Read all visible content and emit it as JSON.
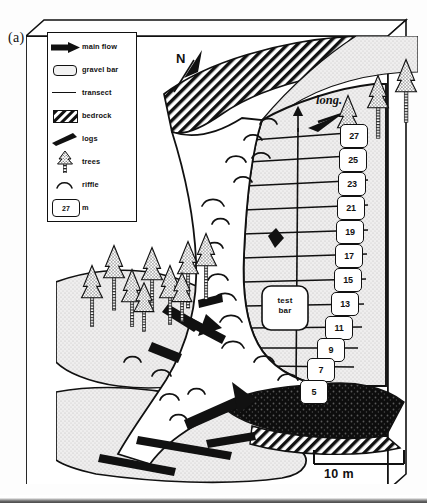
{
  "figure": {
    "panel_label": "(a)",
    "type": "geomorphic-map"
  },
  "legend": {
    "items": [
      {
        "symbol": "main-flow-arrow-icon",
        "label": "main flow"
      },
      {
        "symbol": "gravel-bar-swatch-icon",
        "label": "gravel bar"
      },
      {
        "symbol": "transect-line-icon",
        "label": "transect"
      },
      {
        "symbol": "bedrock-hatch-icon",
        "label": "bedrock"
      },
      {
        "symbol": "log-icon",
        "label": "logs"
      },
      {
        "symbol": "tree-icon",
        "label": "trees"
      },
      {
        "symbol": "riffle-arc-icon",
        "label": "riffle"
      },
      {
        "symbol": "transect-marker-icon",
        "label": "m",
        "box_value": "27"
      }
    ]
  },
  "annotations": {
    "north": "N",
    "longitudinal": "long.",
    "test_bar_line1": "test",
    "test_bar_line2": "bar"
  },
  "scalebar": {
    "label": "10 m",
    "length_m": 10
  },
  "transects": {
    "unit": "m",
    "labels": [
      "27",
      "25",
      "23",
      "21",
      "19",
      "17",
      "15",
      "13",
      "11",
      "9",
      "7",
      "5"
    ]
  },
  "colors": {
    "ink": "#111111",
    "paper": "#ffffff",
    "gravel_fill": "#eceaea",
    "bar_fill": "#e6e4e4",
    "hatch": "#111111"
  }
}
